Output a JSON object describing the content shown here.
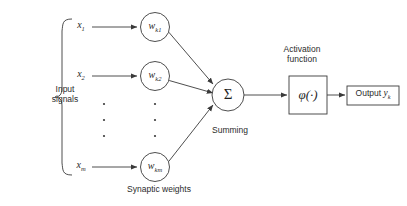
{
  "diagram": {
    "colors": {
      "stroke": "#3a3a3a",
      "text": "#2b2b2b",
      "background": "#ffffff"
    },
    "input_group": {
      "label_line1": "Input",
      "label_line2": "signals",
      "brace": "{"
    },
    "inputs": [
      {
        "symbol": "x",
        "subscript": "1"
      },
      {
        "symbol": "x",
        "subscript": "2"
      },
      {
        "symbol": "x",
        "subscript": "m"
      }
    ],
    "weights": {
      "caption": "Synaptic weights",
      "nodes": [
        {
          "symbol": "w",
          "subscript": "k1"
        },
        {
          "symbol": "w",
          "subscript": "k2"
        },
        {
          "symbol": "w",
          "subscript": "km"
        }
      ]
    },
    "summing": {
      "symbol": "Σ",
      "caption": "Summing"
    },
    "activation": {
      "caption_line1": "Activation",
      "caption_line2": "function",
      "symbol": "φ(·)"
    },
    "output": {
      "label": "Output",
      "symbol": "y",
      "subscript": "k"
    },
    "ellipsis": {
      "glyph": "·",
      "column_count": 2,
      "dots_per_column": 3
    }
  }
}
